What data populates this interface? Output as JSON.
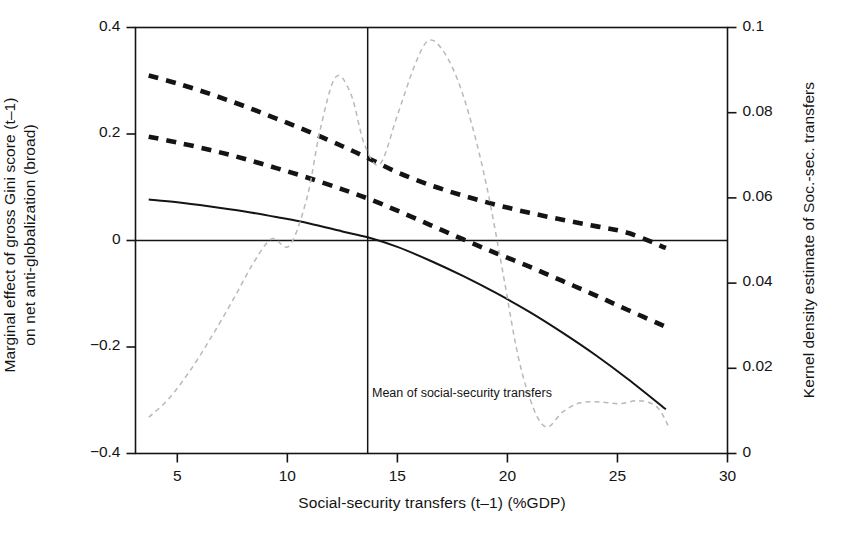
{
  "chart_data": {
    "type": "line",
    "title": "",
    "xlabel": "Social-security transfers (t–1) (%GDP)",
    "ylabel_left": "Marginal effect of gross Gini score (t–1) on net anti-globalization (broad)",
    "ylabel_left_lines": [
      "Marginal effect of gross Gini score (t–1)",
      "on net anti-globalization (broad)"
    ],
    "ylabel_right": "Kernel density estimate of Soc.-sec. transfers",
    "xlim": [
      3.1,
      30.0
    ],
    "ylim_left": [
      -0.4,
      0.4
    ],
    "ylim_right": [
      0.0,
      0.1
    ],
    "xticks": [
      5,
      10,
      15,
      20,
      25,
      30
    ],
    "xticklabels": [
      "5",
      "10",
      "15",
      "20",
      "25",
      "30"
    ],
    "yticks_left": [
      -0.4,
      -0.2,
      0,
      0.2,
      0.4
    ],
    "yticklabels_left": [
      "−0.4",
      "−0.2",
      "0",
      "0.2",
      "0.4"
    ],
    "yticks_right": [
      0,
      0.02,
      0.04,
      0.06,
      0.08,
      0.1
    ],
    "yticklabels_right": [
      "0",
      "0.02",
      "0.04",
      "0.06",
      "0.08",
      "0.1"
    ],
    "grid": false,
    "legend": "none",
    "annotations": [
      {
        "text": "Mean of social-security transfers",
        "x": 13.65,
        "y": -0.3,
        "anchor": "left"
      }
    ],
    "reference_lines": [
      {
        "name": "zero-line",
        "orientation": "horizontal",
        "axis": "left",
        "value": 0,
        "style": "solid"
      },
      {
        "name": "mean-line",
        "orientation": "vertical",
        "axis": "x",
        "value": 13.65,
        "style": "solid"
      }
    ],
    "series": [
      {
        "name": "Marginal effect (point estimate)",
        "style": "solid",
        "axis": "left",
        "x": [
          3.7,
          5.0,
          6.5,
          8.0,
          9.5,
          11.0,
          12.5,
          13.65,
          15.0,
          16.5,
          18.0,
          19.5,
          21.0,
          22.5,
          24.0,
          25.5,
          27.2
        ],
        "y": [
          0.077,
          0.072,
          0.064,
          0.055,
          0.044,
          0.032,
          0.017,
          0.006,
          -0.012,
          -0.038,
          -0.067,
          -0.099,
          -0.134,
          -0.173,
          -0.215,
          -0.261,
          -0.317
        ]
      },
      {
        "name": "Upper 95% confidence bound",
        "style": "dashed",
        "axis": "left",
        "x": [
          3.7,
          5.0,
          6.5,
          8.0,
          9.5,
          11.0,
          12.5,
          13.65,
          15.0,
          16.5,
          18.0,
          19.5,
          21.0,
          22.5,
          24.0,
          25.5,
          27.2
        ],
        "y": [
          0.31,
          0.295,
          0.275,
          0.253,
          0.229,
          0.204,
          0.177,
          0.155,
          0.128,
          0.104,
          0.084,
          0.067,
          0.052,
          0.039,
          0.027,
          0.014,
          -0.014
        ]
      },
      {
        "name": "Lower 95% confidence bound",
        "style": "dashed",
        "axis": "left",
        "x": [
          3.7,
          5.0,
          6.5,
          8.0,
          9.5,
          11.0,
          12.5,
          13.65,
          15.0,
          16.5,
          18.0,
          19.5,
          21.0,
          22.5,
          24.0,
          25.5,
          27.2
        ],
        "y": [
          0.195,
          0.184,
          0.17,
          0.154,
          0.136,
          0.117,
          0.096,
          0.079,
          0.056,
          0.029,
          0.002,
          -0.024,
          -0.049,
          -0.076,
          -0.103,
          -0.131,
          -0.162
        ]
      },
      {
        "name": "Kernel density of social-security transfers",
        "style": "dashed-light",
        "axis": "right",
        "x": [
          3.7,
          4.6,
          5.6,
          6.6,
          7.6,
          8.5,
          9.3,
          10.1,
          10.9,
          11.5,
          12.2,
          12.9,
          13.5,
          14.2,
          15.0,
          15.8,
          16.4,
          17.0,
          17.7,
          18.4,
          19.1,
          19.8,
          20.5,
          21.2,
          21.8,
          22.5,
          23.3,
          24.2,
          25.1,
          26.0,
          26.8,
          27.3
        ],
        "y": [
          0.0085,
          0.0128,
          0.0196,
          0.0278,
          0.0367,
          0.0451,
          0.0504,
          0.0488,
          0.0602,
          0.0762,
          0.0884,
          0.0842,
          0.0726,
          0.0679,
          0.0794,
          0.0913,
          0.0969,
          0.0951,
          0.0882,
          0.0769,
          0.0617,
          0.0423,
          0.0225,
          0.0104,
          0.0062,
          0.0097,
          0.0119,
          0.0121,
          0.0117,
          0.0124,
          0.0109,
          0.0066
        ]
      }
    ]
  },
  "colors": {
    "axis": "#141414",
    "estimate": "#141414",
    "bounds": "#141414",
    "density": "#b9b9b9",
    "background": "#ffffff"
  }
}
